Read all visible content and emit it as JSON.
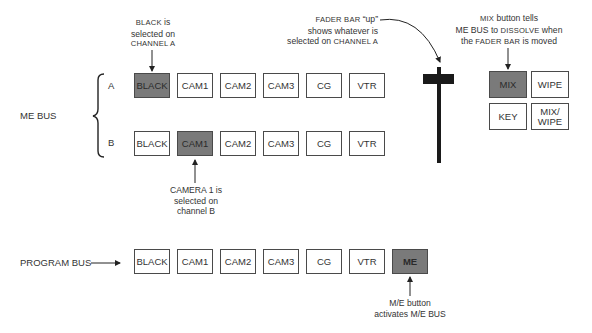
{
  "diagram": {
    "me_bus_label": "ME BUS",
    "channel_a_label": "A",
    "channel_b_label": "B",
    "program_bus_label": "PROGRAM BUS",
    "channel_a_buttons": [
      {
        "label": "BLACK",
        "selected": true
      },
      {
        "label": "CAM1",
        "selected": false
      },
      {
        "label": "CAM2",
        "selected": false
      },
      {
        "label": "CAM3",
        "selected": false
      },
      {
        "label": "CG",
        "selected": false
      },
      {
        "label": "VTR",
        "selected": false
      }
    ],
    "channel_b_buttons": [
      {
        "label": "BLACK",
        "selected": false
      },
      {
        "label": "CAM1",
        "selected": true
      },
      {
        "label": "CAM2",
        "selected": false
      },
      {
        "label": "CAM3",
        "selected": false
      },
      {
        "label": "CG",
        "selected": false
      },
      {
        "label": "VTR",
        "selected": false
      }
    ],
    "program_bus_buttons": [
      {
        "label": "BLACK",
        "selected": false
      },
      {
        "label": "CAM1",
        "selected": false
      },
      {
        "label": "CAM2",
        "selected": false
      },
      {
        "label": "CAM3",
        "selected": false
      },
      {
        "label": "CG",
        "selected": false
      },
      {
        "label": "VTR",
        "selected": false
      },
      {
        "label": "ME",
        "selected": true
      }
    ],
    "transition_buttons": [
      {
        "label": "MIX",
        "selected": true
      },
      {
        "label": "WIPE",
        "selected": false
      },
      {
        "label": "KEY",
        "selected": false
      },
      {
        "label": "MIX/ WIPE",
        "selected": false
      }
    ],
    "annotations": {
      "black_note": {
        "line1_sc": "BLACK",
        "line1_rest": " is",
        "line2": "selected on",
        "line3_sc": "CHANNEL A"
      },
      "camera_note": {
        "line1": "CAMERA 1 is",
        "line2": "selected on",
        "line3": "channel B"
      },
      "fader_note": {
        "line1_sc": "FADER BAR",
        "line1_rest": " “up”",
        "line2": "shows whatever is",
        "line3_pre": "selected on ",
        "line3_sc": "CHANNEL A"
      },
      "mix_note": {
        "line1_sc": "MIX",
        "line1_rest": " button tells",
        "line2_pre": "ME BUS to ",
        "line2_sc": "DISSOLVE",
        "line2_post": " when",
        "line3_pre": "the ",
        "line3_sc": "FADER BAR",
        "line3_post": " is moved"
      },
      "me_note": {
        "line1": "M/E button",
        "line2": "activates M/E BUS"
      }
    },
    "colors": {
      "selected_fill": "#7a7a7a",
      "border": "#4a4a4a",
      "fader": "#1a1a1a"
    }
  }
}
